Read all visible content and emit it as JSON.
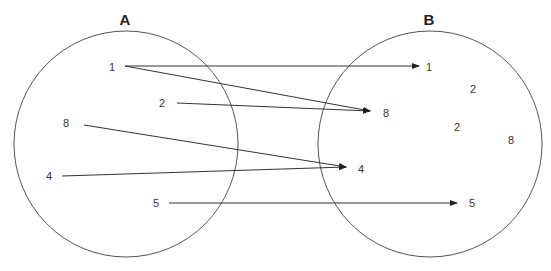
{
  "diagram": {
    "type": "mapping",
    "sets": [
      {
        "id": "A",
        "label": "A",
        "elements": [
          "1",
          "2",
          "8",
          "4",
          "5"
        ]
      },
      {
        "id": "B",
        "label": "B",
        "elements": [
          "1",
          "2",
          "8",
          "2",
          "8",
          "4",
          "5"
        ]
      }
    ],
    "mappings": [
      {
        "from": "1",
        "to": "1"
      },
      {
        "from": "1",
        "to": "8"
      },
      {
        "from": "2",
        "to": "8"
      },
      {
        "from": "8",
        "to": "4"
      },
      {
        "from": "4",
        "to": "4"
      },
      {
        "from": "5",
        "to": "5"
      }
    ],
    "colors": {
      "stroke": "#555555",
      "text": "#333333",
      "background": "#ffffff"
    }
  }
}
